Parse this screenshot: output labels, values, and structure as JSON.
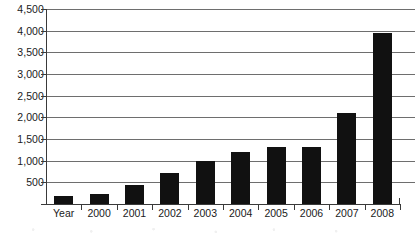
{
  "chart_data": {
    "type": "bar",
    "title": "",
    "subtitle": "",
    "xlabel": "",
    "ylabel": "",
    "categories": [
      "Year",
      "2000",
      "2001",
      "2002",
      "2003",
      "2004",
      "2005",
      "2006",
      "2007",
      "2008"
    ],
    "values": [
      190,
      240,
      440,
      720,
      1000,
      1200,
      1320,
      1320,
      2100,
      3950
    ],
    "series": [
      {
        "name": "",
        "values": [
          190,
          240,
          440,
          720,
          1000,
          1200,
          1320,
          1320,
          2100,
          3950
        ]
      }
    ],
    "ylim": [
      0,
      4500
    ],
    "ytick_values": [
      0,
      500,
      1000,
      1500,
      2000,
      2500,
      3000,
      3500,
      4000,
      4500
    ],
    "ytick_labels": [
      "",
      "500",
      "1,000",
      "1,500",
      "2,000",
      "2,500",
      "3,000",
      "3,500",
      "4,000",
      "4,500"
    ],
    "grid": true,
    "grid_axis": "y",
    "legend": false,
    "legend_position": "none",
    "bar_color": "#111111",
    "gridline_color": "#6e6e6e",
    "axis_color": "#3a3a3a",
    "background_color": "#ffffff",
    "annotations": []
  }
}
